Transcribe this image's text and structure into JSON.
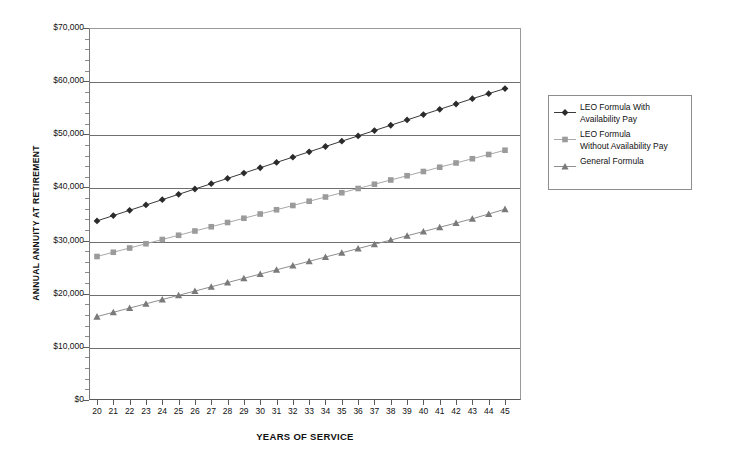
{
  "chart_data": {
    "type": "line",
    "title": "",
    "xlabel": "YEARS OF SERVICE",
    "ylabel": "ANNUAL ANNUITY AT RETIREMENT",
    "xlim": [
      20,
      45
    ],
    "ylim": [
      0,
      70000
    ],
    "ytick_labels": [
      "$0",
      "$10,000",
      "$20,000",
      "$30,000",
      "$40,000",
      "$50,000",
      "$60,000",
      "$70,000"
    ],
    "ytick_values": [
      0,
      10000,
      20000,
      30000,
      40000,
      50000,
      60000,
      70000
    ],
    "yminor_step": 2000,
    "grid": true,
    "grid_axis": "y",
    "legend_position": "right",
    "x": [
      20,
      21,
      22,
      23,
      24,
      25,
      26,
      27,
      28,
      29,
      30,
      31,
      32,
      33,
      34,
      35,
      36,
      37,
      38,
      39,
      40,
      41,
      42,
      43,
      44,
      45
    ],
    "xtick_labels": [
      "20",
      "21",
      "22",
      "23",
      "24",
      "25",
      "26",
      "27",
      "28",
      "29",
      "30",
      "31",
      "32",
      "33",
      "34",
      "35",
      "36",
      "37",
      "38",
      "39",
      "40",
      "41",
      "42",
      "43",
      "44",
      "45"
    ],
    "series": [
      {
        "name": "LEO Formula With Availability Pay",
        "legend_label": "LEO Formula With\nAvailability Pay",
        "marker": "diamond",
        "color": "#2b2b2b",
        "line_color": "#3a3a3a",
        "values": [
          33700,
          34700,
          35700,
          36700,
          37700,
          38700,
          39700,
          40700,
          41700,
          42700,
          43700,
          44700,
          45700,
          46700,
          47700,
          48700,
          49700,
          50700,
          51700,
          52700,
          53700,
          54700,
          55700,
          56700,
          57650,
          58600
        ]
      },
      {
        "name": "LEO Formula Without Availability Pay",
        "legend_label": "LEO Formula\nWithout Availability Pay",
        "marker": "square",
        "color": "#9b9b9b",
        "line_color": "#a8a8a8",
        "values": [
          27000,
          27800,
          28600,
          29400,
          30200,
          31000,
          31800,
          32600,
          33400,
          34200,
          35000,
          35800,
          36600,
          37400,
          38200,
          39000,
          39800,
          40600,
          41400,
          42200,
          43000,
          43800,
          44600,
          45400,
          46200,
          47000
        ]
      },
      {
        "name": "General Formula",
        "legend_label": "General Formula",
        "marker": "triangle",
        "color": "#7a7a7a",
        "line_color": "#8f8f8f",
        "values": [
          15700,
          16500,
          17300,
          18100,
          18900,
          19700,
          20500,
          21300,
          22100,
          22900,
          23700,
          24500,
          25300,
          26100,
          26900,
          27700,
          28500,
          29300,
          30100,
          30900,
          31700,
          32500,
          33300,
          34100,
          35000,
          35900
        ]
      }
    ]
  },
  "colors": {
    "gridline": "#6f6f6f",
    "axis": "#5a5a5a",
    "plot_background": "#ffffff",
    "page_background": "#ffffff",
    "legend_border": "#8d8d8d",
    "text": "#111111"
  }
}
